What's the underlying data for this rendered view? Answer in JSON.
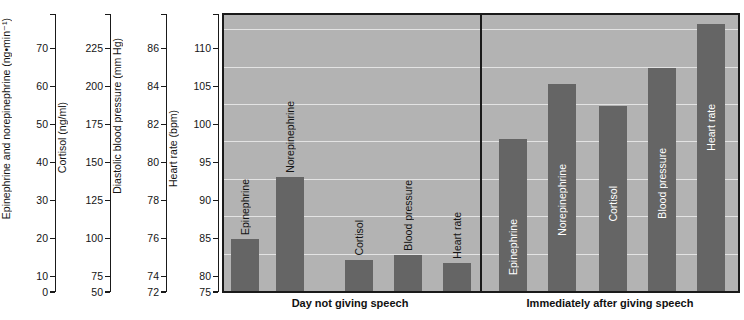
{
  "chart_data": {
    "type": "bar",
    "title": "",
    "categories": [
      "Epinephrine",
      "Norepinephrine",
      "Cortisol",
      "Blood pressure",
      "Heart rate"
    ],
    "groups": [
      {
        "label": "Day not giving speech",
        "values_on_hr_axis": [
          82.0,
          90.3,
          79.2,
          79.8,
          78.8
        ],
        "native_values": [
          22,
          43,
          96,
          77.4,
          78.8
        ],
        "native_units": [
          "ng·min⁻¹",
          "ng·min⁻¹",
          "ng/ml",
          "mm Hg",
          "bpm"
        ]
      },
      {
        "label": "Immediately after giving speech",
        "values_on_hr_axis": [
          95.3,
          102.7,
          99.8,
          104.8,
          110.7
        ],
        "native_values": [
          51,
          72,
          146,
          82.5,
          110.7
        ],
        "native_units": [
          "ng·min⁻¹",
          "ng·min⁻¹",
          "ng/ml",
          "mm Hg",
          "bpm"
        ]
      }
    ],
    "reference_axis": "Heart rate (bpm)",
    "reference_ylim": [
      75,
      111.9
    ],
    "grid": true,
    "gridlines": [
      80,
      85,
      90,
      95,
      100,
      105,
      110
    ],
    "legend_position": "none",
    "colors": {
      "bar": "#656565",
      "plot_background": "#b3b3b3",
      "gridline": "#e3e3e3",
      "frame": "#1a1a1a",
      "label_inside": "#ffffff",
      "label_outside": "#141414"
    }
  },
  "axes": [
    {
      "name": "epinephrine-axis",
      "title": "Epinephrine and norepinephrine (ng•min⁻¹)",
      "ticks": [
        "70",
        "60",
        "50",
        "40",
        "30",
        "20",
        "10",
        "0"
      ],
      "min": 0,
      "max": 78.6
    },
    {
      "name": "cortisol-axis",
      "title": "Cortisol (ng/ml)",
      "ticks": [
        "225",
        "200",
        "175",
        "150",
        "125",
        "100",
        "75",
        "50"
      ],
      "min": 50,
      "max": 246.5
    },
    {
      "name": "blood-pressure-axis",
      "title": "Diastolic blood pressure (mm Hg)",
      "ticks": [
        "86",
        "84",
        "82",
        "80",
        "78",
        "76",
        "74",
        "72"
      ],
      "min": 72,
      "max": 87.7
    },
    {
      "name": "heart-rate-axis",
      "title": "Heart rate (bpm)",
      "ticks": [
        "110",
        "105",
        "100",
        "95",
        "90",
        "85",
        "80",
        "75"
      ],
      "min": 75,
      "max": 111.9
    }
  ]
}
